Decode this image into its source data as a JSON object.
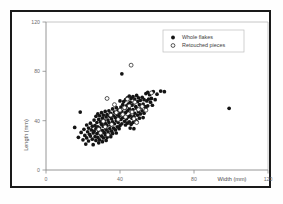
{
  "chart_data": {
    "type": "scatter",
    "title": "",
    "xlabel": "Width (mm)",
    "ylabel": "Length (mm)",
    "xlim": [
      0,
      120
    ],
    "ylim": [
      0,
      120
    ],
    "xticks": [
      0,
      40,
      80,
      120
    ],
    "yticks": [
      0,
      40,
      80,
      120
    ],
    "xtick_labels": [
      "0",
      "40",
      "80",
      "120"
    ],
    "ytick_labels": [
      "0",
      "40",
      "80",
      "120"
    ],
    "grid": false,
    "legend_position": "upper-right",
    "series": [
      {
        "name": "Whole flakes",
        "marker": "filled-circle",
        "color": "#141414",
        "points": [
          [
            15.5,
            34.5
          ],
          [
            18.5,
            47.0
          ],
          [
            17.5,
            26.5
          ],
          [
            19.0,
            30.5
          ],
          [
            20.0,
            24.5
          ],
          [
            20.5,
            33.0
          ],
          [
            21.0,
            28.0
          ],
          [
            21.5,
            21.0
          ],
          [
            22.0,
            36.5
          ],
          [
            22.5,
            31.0
          ],
          [
            22.0,
            26.0
          ],
          [
            23.0,
            34.0
          ],
          [
            23.5,
            29.0
          ],
          [
            23.0,
            23.5
          ],
          [
            24.0,
            38.0
          ],
          [
            24.5,
            32.5
          ],
          [
            24.0,
            27.5
          ],
          [
            25.0,
            35.5
          ],
          [
            25.5,
            30.0
          ],
          [
            25.0,
            25.0
          ],
          [
            25.5,
            20.5
          ],
          [
            26.0,
            40.5
          ],
          [
            26.5,
            36.0
          ],
          [
            26.0,
            31.5
          ],
          [
            26.5,
            27.0
          ],
          [
            27.0,
            43.5
          ],
          [
            27.5,
            38.5
          ],
          [
            27.0,
            33.5
          ],
          [
            27.5,
            29.5
          ],
          [
            27.0,
            24.0
          ],
          [
            28.0,
            45.5
          ],
          [
            28.5,
            41.0
          ],
          [
            28.0,
            35.0
          ],
          [
            28.5,
            30.5
          ],
          [
            28.0,
            26.5
          ],
          [
            28.5,
            22.0
          ],
          [
            29.0,
            44.0
          ],
          [
            29.5,
            39.0
          ],
          [
            29.0,
            34.0
          ],
          [
            29.5,
            29.0
          ],
          [
            29.0,
            24.5
          ],
          [
            30.0,
            46.5
          ],
          [
            30.5,
            42.0
          ],
          [
            30.0,
            37.0
          ],
          [
            30.5,
            32.0
          ],
          [
            30.0,
            27.5
          ],
          [
            30.5,
            23.0
          ],
          [
            31.0,
            44.5
          ],
          [
            31.5,
            40.0
          ],
          [
            31.0,
            35.5
          ],
          [
            31.5,
            30.5
          ],
          [
            31.0,
            26.0
          ],
          [
            32.0,
            47.5
          ],
          [
            32.5,
            43.0
          ],
          [
            32.0,
            38.0
          ],
          [
            32.5,
            33.0
          ],
          [
            32.0,
            28.5
          ],
          [
            32.5,
            24.0
          ],
          [
            33.0,
            45.0
          ],
          [
            33.5,
            40.5
          ],
          [
            33.0,
            36.0
          ],
          [
            33.5,
            31.0
          ],
          [
            33.0,
            26.5
          ],
          [
            34.0,
            48.0
          ],
          [
            34.5,
            43.5
          ],
          [
            34.0,
            38.5
          ],
          [
            34.5,
            33.5
          ],
          [
            34.0,
            29.0
          ],
          [
            35.0,
            46.0
          ],
          [
            35.5,
            41.5
          ],
          [
            35.0,
            36.5
          ],
          [
            35.5,
            31.5
          ],
          [
            35.0,
            27.0
          ],
          [
            36.0,
            49.5
          ],
          [
            36.5,
            44.0
          ],
          [
            36.0,
            39.0
          ],
          [
            36.5,
            34.0
          ],
          [
            36.0,
            29.5
          ],
          [
            37.0,
            47.0
          ],
          [
            37.5,
            42.5
          ],
          [
            37.0,
            37.5
          ],
          [
            37.5,
            32.5
          ],
          [
            38.0,
            50.5
          ],
          [
            38.5,
            45.0
          ],
          [
            38.0,
            40.0
          ],
          [
            38.5,
            35.0
          ],
          [
            38.0,
            30.0
          ],
          [
            39.0,
            48.5
          ],
          [
            39.5,
            43.5
          ],
          [
            39.0,
            38.5
          ],
          [
            39.5,
            33.5
          ],
          [
            40.0,
            56.0
          ],
          [
            40.5,
            51.0
          ],
          [
            40.0,
            46.0
          ],
          [
            40.5,
            41.0
          ],
          [
            40.0,
            36.0
          ],
          [
            41.0,
            78.0
          ],
          [
            41.5,
            53.0
          ],
          [
            41.0,
            47.5
          ],
          [
            41.5,
            42.5
          ],
          [
            41.0,
            37.5
          ],
          [
            42.0,
            55.5
          ],
          [
            42.5,
            50.0
          ],
          [
            42.0,
            44.5
          ],
          [
            42.5,
            39.5
          ],
          [
            43.0,
            57.0
          ],
          [
            43.5,
            52.0
          ],
          [
            43.0,
            46.5
          ],
          [
            43.5,
            41.5
          ],
          [
            43.0,
            36.5
          ],
          [
            44.0,
            58.5
          ],
          [
            44.5,
            53.5
          ],
          [
            44.0,
            48.0
          ],
          [
            44.5,
            43.0
          ],
          [
            44.0,
            38.0
          ],
          [
            45.0,
            60.0
          ],
          [
            45.5,
            55.0
          ],
          [
            45.0,
            49.5
          ],
          [
            45.5,
            44.0
          ],
          [
            45.0,
            39.0
          ],
          [
            45.5,
            34.0
          ],
          [
            46.0,
            58.0
          ],
          [
            46.5,
            52.5
          ],
          [
            46.0,
            47.0
          ],
          [
            46.5,
            42.0
          ],
          [
            46.0,
            37.0
          ],
          [
            47.0,
            59.5
          ],
          [
            47.5,
            54.5
          ],
          [
            47.0,
            49.0
          ],
          [
            47.5,
            43.5
          ],
          [
            47.0,
            38.5
          ],
          [
            47.5,
            33.5
          ],
          [
            48.0,
            57.5
          ],
          [
            48.5,
            51.5
          ],
          [
            48.0,
            46.0
          ],
          [
            48.5,
            40.5
          ],
          [
            49.0,
            60.5
          ],
          [
            49.5,
            55.5
          ],
          [
            49.0,
            50.0
          ],
          [
            49.5,
            44.5
          ],
          [
            49.0,
            39.5
          ],
          [
            50.0,
            58.5
          ],
          [
            50.5,
            53.0
          ],
          [
            50.0,
            47.5
          ],
          [
            50.5,
            42.0
          ],
          [
            51.0,
            56.5
          ],
          [
            51.5,
            51.0
          ],
          [
            51.0,
            45.5
          ],
          [
            52.0,
            59.0
          ],
          [
            52.5,
            53.5
          ],
          [
            52.0,
            48.0
          ],
          [
            52.5,
            42.5
          ],
          [
            53.0,
            57.0
          ],
          [
            53.5,
            51.5
          ],
          [
            53.0,
            46.0
          ],
          [
            54.0,
            62.0
          ],
          [
            54.5,
            56.0
          ],
          [
            54.0,
            50.5
          ],
          [
            55.0,
            63.0
          ],
          [
            55.5,
            57.5
          ],
          [
            55.0,
            52.0
          ],
          [
            56.0,
            61.0
          ],
          [
            56.5,
            55.0
          ],
          [
            57.0,
            58.0
          ],
          [
            57.5,
            52.5
          ],
          [
            58.0,
            63.5
          ],
          [
            59.0,
            57.0
          ],
          [
            60.0,
            61.5
          ],
          [
            62.0,
            64.0
          ],
          [
            64.0,
            63.5
          ],
          [
            99.0,
            50.0
          ]
        ]
      },
      {
        "name": "Retouched pieces",
        "marker": "open-circle",
        "color": "#ffffff",
        "points": [
          [
            28.5,
            33.0
          ],
          [
            29.5,
            30.0
          ],
          [
            31.0,
            39.5
          ],
          [
            32.0,
            35.0
          ],
          [
            33.0,
            58.0
          ],
          [
            33.5,
            28.5
          ],
          [
            35.0,
            44.5
          ],
          [
            35.5,
            37.0
          ],
          [
            37.0,
            53.0
          ],
          [
            38.0,
            46.5
          ],
          [
            39.0,
            41.0
          ],
          [
            40.0,
            48.5
          ],
          [
            41.5,
            45.0
          ],
          [
            42.5,
            50.5
          ],
          [
            43.0,
            43.0
          ],
          [
            44.0,
            57.5
          ],
          [
            45.0,
            52.0
          ],
          [
            46.0,
            85.0
          ],
          [
            46.5,
            47.0
          ],
          [
            47.5,
            41.5
          ],
          [
            48.0,
            55.0
          ],
          [
            49.0,
            38.5
          ],
          [
            50.0,
            49.0
          ],
          [
            52.0,
            51.5
          ],
          [
            54.0,
            48.5
          ],
          [
            57.0,
            62.5
          ]
        ]
      }
    ]
  },
  "legend": {
    "entries": [
      {
        "label": "Whole flakes",
        "marker": "filled-circle"
      },
      {
        "label": "Retouched pieces",
        "marker": "open-circle"
      }
    ]
  },
  "axes": {
    "x_title": "Width (mm)",
    "y_title": "Length (mm)"
  }
}
